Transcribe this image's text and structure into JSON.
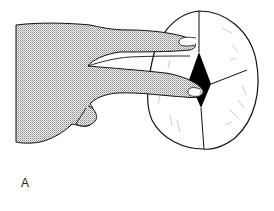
{
  "figure": {
    "panel_label": "A",
    "elements": {
      "hand": "stippled hand with index and middle fingers extended",
      "skull": "oval skull outline with sutures",
      "fontanelle": "black diamond-shaped fontanelle at suture junction"
    },
    "colors": {
      "line": "#111111",
      "stipple": "#9a9a9a",
      "fontanelle": "#000000",
      "background": "#ffffff"
    }
  }
}
